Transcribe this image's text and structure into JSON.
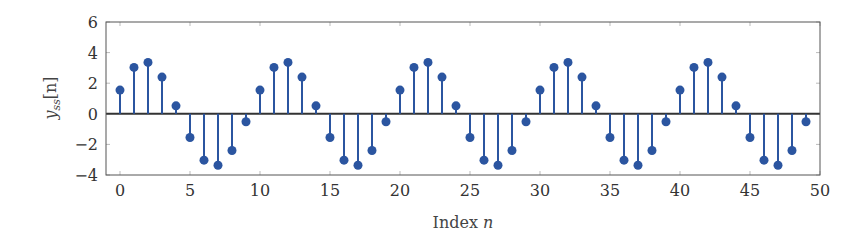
{
  "chart_data": {
    "type": "stem",
    "title": "",
    "xlabel": "Index n",
    "xlabel_text": "Index ",
    "xlabel_var": "n",
    "ylabel": "y_ss[n]",
    "ylabel_var": "y",
    "ylabel_sub": "ss",
    "ylabel_arg": "[n]",
    "xlim": [
      -1,
      50
    ],
    "ylim": [
      -4,
      6
    ],
    "xticks": [
      0,
      5,
      10,
      15,
      20,
      25,
      30,
      35,
      40,
      45,
      50
    ],
    "yticks": [
      -4,
      -2,
      0,
      2,
      4,
      6
    ],
    "ytick_labels": [
      "−4",
      "−2",
      "0",
      "2",
      "4",
      "6"
    ],
    "grid": false,
    "legend": null,
    "color": "#2b55a0",
    "baseline_color": "#333333",
    "series": [
      {
        "name": "y_ss[n]",
        "x": [
          0,
          1,
          2,
          3,
          4,
          5,
          6,
          7,
          8,
          9,
          10,
          11,
          12,
          13,
          14,
          15,
          16,
          17,
          18,
          19,
          20,
          21,
          22,
          23,
          24,
          25,
          26,
          27,
          28,
          29,
          30,
          31,
          32,
          33,
          34,
          35,
          36,
          37,
          38,
          39,
          40,
          41,
          42,
          43,
          44,
          45,
          46,
          47,
          48,
          49
        ],
        "values": [
          1.55,
          3.03,
          3.36,
          2.4,
          0.52,
          -1.55,
          -3.03,
          -3.36,
          -2.4,
          -0.52,
          1.55,
          3.03,
          3.36,
          2.4,
          0.52,
          -1.55,
          -3.03,
          -3.36,
          -2.4,
          -0.52,
          1.55,
          3.03,
          3.36,
          2.4,
          0.52,
          -1.55,
          -3.03,
          -3.36,
          -2.4,
          -0.52,
          1.55,
          3.03,
          3.36,
          2.4,
          0.52,
          -1.55,
          -3.03,
          -3.36,
          -2.4,
          -0.52,
          1.55,
          3.03,
          3.36,
          2.4,
          0.52,
          -1.55,
          -3.03,
          -3.36,
          -2.4,
          -0.52
        ]
      }
    ]
  }
}
